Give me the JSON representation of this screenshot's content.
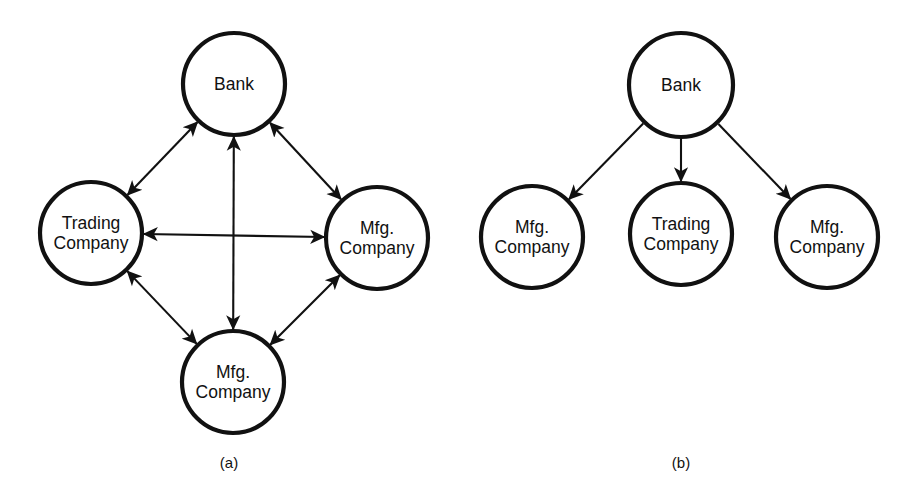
{
  "figure": {
    "background_color": "#ffffff",
    "stroke_color": "#111111",
    "panels": [
      {
        "id": "panel-a",
        "caption": "(a)",
        "caption_x": 229,
        "caption_y": 468,
        "edge_style": "bidirectional",
        "nodes": [
          {
            "id": "a-bank",
            "label_lines": [
              "Bank"
            ],
            "cx": 234,
            "cy": 84,
            "r": 51
          },
          {
            "id": "a-trading",
            "label_lines": [
              "Trading",
              "Company"
            ],
            "cx": 91,
            "cy": 233,
            "r": 51
          },
          {
            "id": "a-mfg-right",
            "label_lines": [
              "Mfg.",
              "Company"
            ],
            "cx": 377,
            "cy": 238,
            "r": 51
          },
          {
            "id": "a-mfg-bottom",
            "label_lines": [
              "Mfg.",
              "Company"
            ],
            "cx": 233,
            "cy": 382,
            "r": 51
          }
        ],
        "edges": [
          {
            "id": "a-edge-bank-trading",
            "from": "a-bank",
            "to": "a-trading",
            "heads": "both"
          },
          {
            "id": "a-edge-bank-mfgright",
            "from": "a-bank",
            "to": "a-mfg-right",
            "heads": "both"
          },
          {
            "id": "a-edge-bank-mfgbottom",
            "from": "a-bank",
            "to": "a-mfg-bottom",
            "heads": "both"
          },
          {
            "id": "a-edge-trading-mfgright",
            "from": "a-trading",
            "to": "a-mfg-right",
            "heads": "both"
          },
          {
            "id": "a-edge-trading-mfgbottom",
            "from": "a-trading",
            "to": "a-mfg-bottom",
            "heads": "both"
          },
          {
            "id": "a-edge-mfgbottom-mfgright",
            "from": "a-mfg-bottom",
            "to": "a-mfg-right",
            "heads": "both"
          }
        ]
      },
      {
        "id": "panel-b",
        "caption": "(b)",
        "caption_x": 681,
        "caption_y": 468,
        "edge_style": "directed-from-bank",
        "nodes": [
          {
            "id": "b-bank",
            "label_lines": [
              "Bank"
            ],
            "cx": 681,
            "cy": 85,
            "r": 52
          },
          {
            "id": "b-mfg-left",
            "label_lines": [
              "Mfg.",
              "Company"
            ],
            "cx": 532,
            "cy": 237,
            "r": 51
          },
          {
            "id": "b-trading",
            "label_lines": [
              "Trading",
              "Company"
            ],
            "cx": 681,
            "cy": 234,
            "r": 51
          },
          {
            "id": "b-mfg-right",
            "label_lines": [
              "Mfg.",
              "Company"
            ],
            "cx": 827,
            "cy": 237,
            "r": 51
          }
        ],
        "edges": [
          {
            "id": "b-edge-bank-mfgleft",
            "from": "b-bank",
            "to": "b-mfg-left",
            "heads": "end"
          },
          {
            "id": "b-edge-bank-trading",
            "from": "b-bank",
            "to": "b-trading",
            "heads": "end"
          },
          {
            "id": "b-edge-bank-mfgright",
            "from": "b-bank",
            "to": "b-mfg-right",
            "heads": "end"
          }
        ]
      }
    ]
  }
}
